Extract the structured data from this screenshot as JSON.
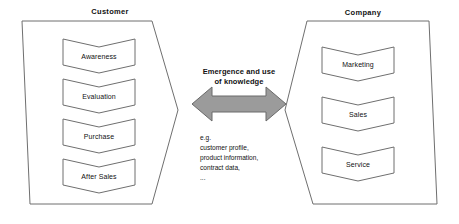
{
  "diagram": {
    "title_customer": "Customer",
    "title_company": "Company",
    "customer": {
      "label": "Customer",
      "stages": [
        {
          "label": "Awareness"
        },
        {
          "label": "Evaluation"
        },
        {
          "label": "Purchase"
        },
        {
          "label": "After Sales"
        }
      ]
    },
    "company": {
      "label": "Company",
      "stages": [
        {
          "label": "Marketing"
        },
        {
          "label": "Sales"
        },
        {
          "label": "Service"
        }
      ]
    },
    "center": {
      "arrow_label_line1": "Emergence and use",
      "arrow_label_line2": "of knowledge",
      "examples": [
        "e.g.",
        "customer profile,",
        "product information,",
        "contract data,",
        "..."
      ]
    },
    "colors": {
      "outline": "#6f6f6f",
      "arrow_fill": "#9b9b9b",
      "arrow_stroke": "#6a6a6a",
      "text": "#111111",
      "background": "#ffffff"
    }
  }
}
